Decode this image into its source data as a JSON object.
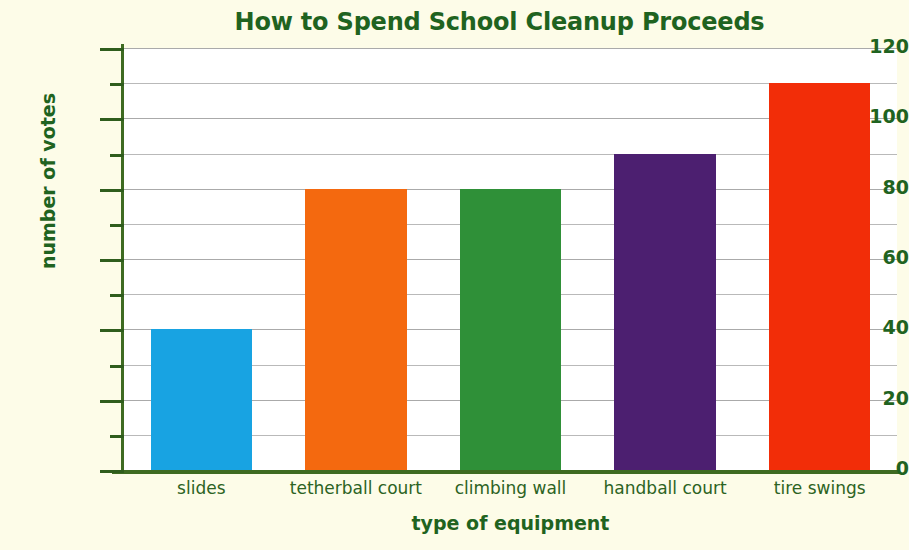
{
  "chart_data": {
    "type": "bar",
    "title": "How to Spend School Cleanup Proceeds",
    "xlabel": "type of equipment",
    "ylabel": "number of votes",
    "categories": [
      "slides",
      "tetherball court",
      "climbing wall",
      "handball court",
      "tire swings"
    ],
    "values": [
      40,
      80,
      80,
      90,
      110
    ],
    "series": [
      {
        "name": "number of votes",
        "values": [
          40,
          80,
          80,
          90,
          110
        ]
      }
    ],
    "bar_colors": [
      "#18a3e2",
      "#f4690f",
      "#2f9038",
      "#4c1f70",
      "#f22d08"
    ],
    "ylim": [
      0,
      120
    ],
    "ytick_labels": [
      "0",
      "20",
      "40",
      "60",
      "80",
      "100",
      "120"
    ],
    "ytick_values": [
      0,
      20,
      40,
      60,
      80,
      100,
      120
    ],
    "yminor_values": [
      10,
      30,
      50,
      70,
      90,
      110
    ],
    "ytick_interval_major": 20,
    "ytick_interval_minor": 10,
    "grid": "horizontal",
    "legend": "none",
    "colors": {
      "background": "#fdfce8",
      "plot_background": "#ffffff",
      "text": "#1f6320",
      "category_text": "#2c6323",
      "axis": "#3e6b21",
      "gridline": "#aaaaaa"
    }
  }
}
